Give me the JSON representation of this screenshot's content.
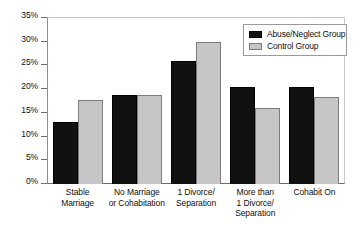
{
  "chart_data": {
    "type": "bar",
    "title": "",
    "subtitle": "",
    "xlabel": "",
    "ylabel": "",
    "ylim": [
      0,
      35
    ],
    "ytick_labels": [
      "35%",
      "30%",
      "25%",
      "20%",
      "15%",
      "10%",
      "5%",
      "0%"
    ],
    "ytick_values": [
      35,
      30,
      25,
      20,
      15,
      10,
      5,
      0
    ],
    "grid": false,
    "legend_position": "top-right",
    "categories": [
      "Stable Marriage",
      "No Marriage or Cohabitation",
      "1 Divorce/ Separation",
      "More than 1 Divorce/ Separation",
      "Cohabit On"
    ],
    "category_lines": [
      [
        "Stable",
        "Marriage"
      ],
      [
        "No Marriage",
        "or Cohabitation"
      ],
      [
        "1 Divorce/",
        "Separation"
      ],
      [
        "More than",
        "1 Divorce/",
        "Separation"
      ],
      [
        "Cohabit On"
      ]
    ],
    "series": [
      {
        "name": "Abuse/Neglect Group",
        "color": "#111111",
        "values": [
          13,
          18.7,
          26,
          20.5,
          20.5
        ]
      },
      {
        "name": "Control Group",
        "color": "#c6c6c6",
        "values": [
          17.8,
          18.7,
          30,
          16,
          18.3
        ]
      }
    ]
  },
  "legend": {
    "items": [
      {
        "label": "Abuse/Neglect Group",
        "swatch": "black-square-icon"
      },
      {
        "label": "Control Group",
        "swatch": "gray-square-icon"
      }
    ]
  }
}
